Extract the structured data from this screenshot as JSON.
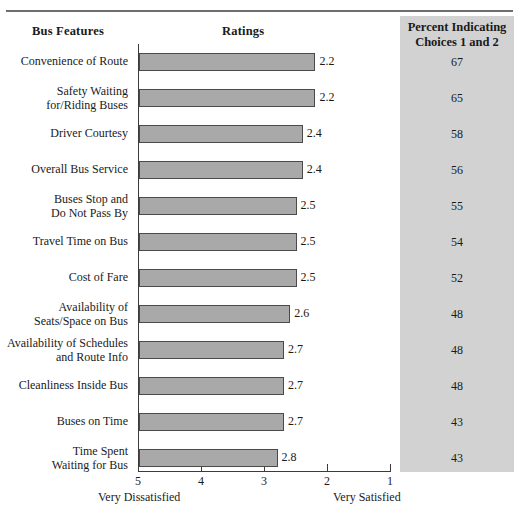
{
  "headers": {
    "features": "Bus Features",
    "ratings": "Ratings",
    "panel_line1": "Percent Indicating",
    "panel_line2": "Choices 1 and 2"
  },
  "axis": {
    "ticks": [
      "5",
      "4",
      "3",
      "2",
      "1"
    ],
    "caption_left": "Very Dissatisfied",
    "caption_right": "Very Satisfied"
  },
  "colors": {
    "bar_fill": "#a9a9a9",
    "bar_stroke": "#4a4a4a",
    "panel_bg": "#d2d2d2",
    "axis": "#3b3b3b"
  },
  "chart_data": {
    "type": "bar",
    "title": "",
    "xlabel": "Ratings",
    "ylabel": "Bus Features",
    "orientation": "horizontal",
    "xlim": [
      5,
      1
    ],
    "x_reversed": true,
    "grid": false,
    "legend": null,
    "categories": [
      "Convenience of Route",
      "Safety Waiting for/Riding Buses",
      "Driver Courtesy",
      "Overall Bus Service",
      "Buses Stop and Do Not Pass By",
      "Travel Time on Bus",
      "Cost of Fare",
      "Availability of Seats/Space on Bus",
      "Availability of Schedules and Route Info",
      "Cleanliness Inside Bus",
      "Buses on Time",
      "Time Spent Waiting for Bus"
    ],
    "values": [
      2.2,
      2.2,
      2.4,
      2.4,
      2.5,
      2.5,
      2.5,
      2.6,
      2.7,
      2.7,
      2.7,
      2.8
    ],
    "series": [
      {
        "name": "Ratings",
        "values": [
          2.2,
          2.2,
          2.4,
          2.4,
          2.5,
          2.5,
          2.5,
          2.6,
          2.7,
          2.7,
          2.7,
          2.8
        ]
      },
      {
        "name": "Percent Indicating Choices 1 and 2",
        "values": [
          67,
          65,
          58,
          56,
          55,
          54,
          52,
          48,
          48,
          48,
          43,
          43
        ]
      }
    ]
  },
  "rows": [
    {
      "label_lines": [
        "Convenience of Route"
      ],
      "value": "2.2",
      "percent": "67"
    },
    {
      "label_lines": [
        "Safety Waiting",
        "for/Riding Buses"
      ],
      "value": "2.2",
      "percent": "65"
    },
    {
      "label_lines": [
        "Driver Courtesy"
      ],
      "value": "2.4",
      "percent": "58"
    },
    {
      "label_lines": [
        "Overall Bus Service"
      ],
      "value": "2.4",
      "percent": "56"
    },
    {
      "label_lines": [
        "Buses Stop and",
        "Do Not Pass By"
      ],
      "value": "2.5",
      "percent": "55"
    },
    {
      "label_lines": [
        "Travel Time on Bus"
      ],
      "value": "2.5",
      "percent": "54"
    },
    {
      "label_lines": [
        "Cost of Fare"
      ],
      "value": "2.5",
      "percent": "52"
    },
    {
      "label_lines": [
        "Availability of",
        "Seats/Space on Bus"
      ],
      "value": "2.6",
      "percent": "48"
    },
    {
      "label_lines": [
        "Availability of Schedules",
        "and Route Info"
      ],
      "value": "2.7",
      "percent": "48"
    },
    {
      "label_lines": [
        "Cleanliness Inside Bus"
      ],
      "value": "2.7",
      "percent": "48"
    },
    {
      "label_lines": [
        "Buses on Time"
      ],
      "value": "2.7",
      "percent": "43"
    },
    {
      "label_lines": [
        "Time Spent",
        "Waiting for Bus"
      ],
      "value": "2.8",
      "percent": "43"
    }
  ]
}
